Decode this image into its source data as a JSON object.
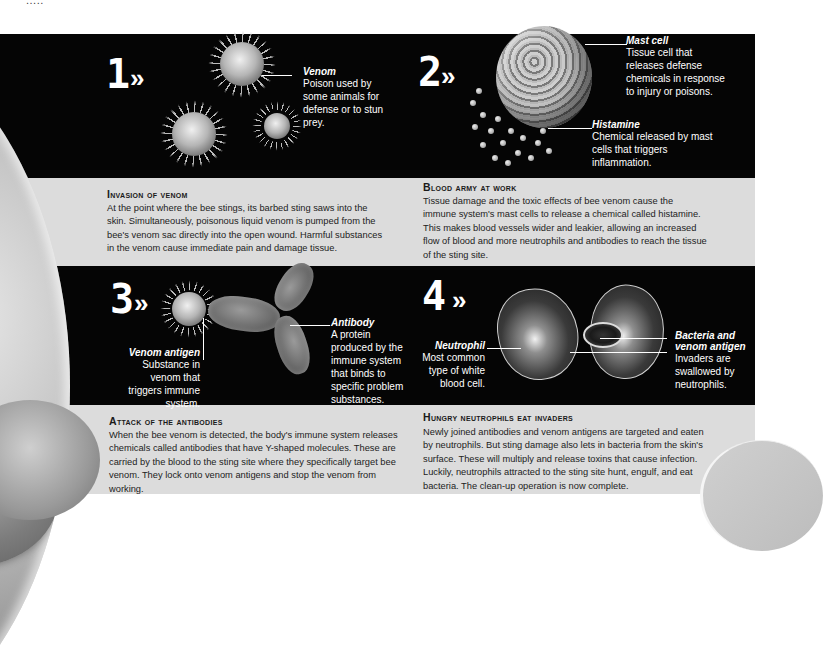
{
  "header": {
    "fragment": "....."
  },
  "steps": [
    {
      "number": "1",
      "arrow": "»",
      "labels": [
        {
          "title": "Venom",
          "text": "Poison used by some animals for defense or to stun prey."
        }
      ],
      "section": {
        "title": "Invasion of venom",
        "body": "At the point where the bee stings, its barbed sting saws into the skin. Simultaneously, poisonous liquid venom is pumped from the bee's venom sac directly into the open wound. Harmful substances in the venom cause immediate pain and damage tissue."
      }
    },
    {
      "number": "2",
      "arrow": "»",
      "labels": [
        {
          "title": "Mast cell",
          "text": "Tissue cell that releases defense chemicals in response to injury or poisons."
        },
        {
          "title": "Histamine",
          "text": "Chemical released by mast cells that triggers inflammation."
        }
      ],
      "section": {
        "title": "Blood army at work",
        "body": "Tissue damage and the toxic effects of bee venom cause the immune system's mast cells to release a chemical called histamine. This makes blood vessels wider and leakier, allowing an increased flow of blood and more neutrophils and antibodies to reach the tissue of the sting site."
      }
    },
    {
      "number": "3",
      "arrow": "»",
      "labels": [
        {
          "title": "Venom antigen",
          "text": "Substance in venom that triggers immune system."
        },
        {
          "title": "Antibody",
          "text": "A protein produced by the immune system that binds to specific problem substances."
        }
      ],
      "section": {
        "title": "Attack of the antibodies",
        "body": "When the bee venom is detected, the body's immune system releases chemicals called antibodies that have Y-shaped molecules. These are carried by the blood to the sting site where they specifically target bee venom. They lock onto venom antigens and stop the venom from working."
      }
    },
    {
      "number": "4",
      "arrow": "»",
      "labels": [
        {
          "title": "Neutrophil",
          "text": "Most common type of white blood cell."
        },
        {
          "title": "Bacteria and venom antigen",
          "text": "Invaders are swallowed by neutrophils."
        }
      ],
      "section": {
        "title": "Hungry neutrophils eat invaders",
        "body": "Newly joined antibodies and venom antigens are targeted and eaten by neutrophils. But sting damage also lets in bacteria from the skin's surface. These will multiply and release toxins that cause infection. Luckily, neutrophils attracted to the sting site hunt, engulf, and eat bacteria. The clean-up operation is now complete."
      }
    }
  ],
  "colors": {
    "panel_background": "#050505",
    "text_band_background": "#dcdcdc",
    "label_text": "#ffffff",
    "body_text": "#222222"
  }
}
